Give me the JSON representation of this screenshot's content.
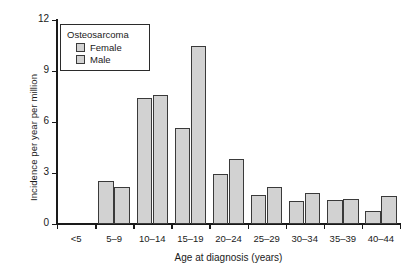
{
  "chart_data": {
    "type": "bar",
    "title": "",
    "xlabel": "Age at diagnosis (years)",
    "ylabel": "Incidence per year per million",
    "categories": [
      "<5",
      "5–9",
      "10–14",
      "15–19",
      "20–24",
      "25–29",
      "30–34",
      "35–39",
      "40–44"
    ],
    "series": [
      {
        "name": "Female",
        "values": [
          0,
          2.55,
          7.4,
          5.65,
          2.95,
          1.7,
          1.35,
          1.4,
          0.75
        ]
      },
      {
        "name": "Male",
        "values": [
          0,
          2.2,
          7.6,
          10.45,
          3.85,
          2.2,
          1.8,
          1.45,
          1.65
        ]
      }
    ],
    "ylim": [
      0,
      12
    ],
    "yticks": [
      0,
      3,
      6,
      9,
      12
    ],
    "ytick_labels": [
      "0",
      "3",
      "6",
      "9",
      "12"
    ],
    "grid": false,
    "legend_title": "Osteosarcoma",
    "legend_position": "upper-left-inside",
    "bar_fill_color": "#d2d2d2",
    "bar_edge_color": "#3a3a3a",
    "axis_color": "#1a1a1a"
  },
  "legend": {
    "title": "Osteosarcoma",
    "entries": [
      {
        "label": "Female"
      },
      {
        "label": "Male"
      }
    ]
  },
  "axes": {
    "x_title": "Age at diagnosis (years)",
    "y_title": "Incidence per year per million"
  }
}
